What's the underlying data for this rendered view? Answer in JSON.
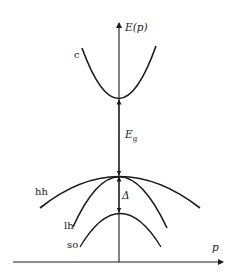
{
  "diagram": {
    "axes": {
      "y_label": "E(p)",
      "x_label": "p"
    },
    "bands": [
      {
        "id": "c",
        "label": "c",
        "description": "conduction band"
      },
      {
        "id": "hh",
        "label": "hh",
        "description": "heavy-hole band"
      },
      {
        "id": "lh",
        "label": "lh",
        "description": "light-hole band"
      },
      {
        "id": "so",
        "label": "so",
        "description": "split-off band"
      }
    ],
    "gaps": {
      "band_gap": {
        "symbol": "E",
        "subscript": "g"
      },
      "spin_orbit_splitting": {
        "symbol": "Δ"
      }
    },
    "colors": {
      "line": "#1a1a1a",
      "background": "#ffffff"
    }
  }
}
